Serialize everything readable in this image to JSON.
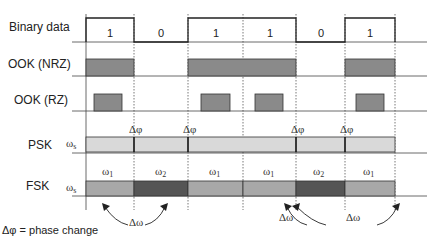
{
  "rows": {
    "binary": "Binary data",
    "ook_nrz": "OOK (NRZ)",
    "ook_rz": "OOK (RZ)",
    "psk": "PSK",
    "fsk": "FSK"
  },
  "bits": [
    "1",
    "0",
    "1",
    "1",
    "0",
    "1"
  ],
  "carrier_symbol": "ω",
  "carrier_sub": "s",
  "phase_change_symbol": "Δφ",
  "freq_change_symbol": "Δω",
  "fsk_freqs": [
    {
      "sym": "ω",
      "sub": "1"
    },
    {
      "sym": "ω",
      "sub": "2"
    },
    {
      "sym": "ω",
      "sub": "1"
    },
    {
      "sym": "ω",
      "sub": "1"
    },
    {
      "sym": "ω",
      "sub": "2"
    },
    {
      "sym": "ω",
      "sub": "1"
    }
  ],
  "legend": "Δφ = phase change",
  "colors": {
    "nrz_fill": "#8a8a8a",
    "rz_fill": "#8a8a8a",
    "psk_fill": "#d9d9d9",
    "fsk_light": "#a8a8a8",
    "fsk_dark": "#555555",
    "line": "#333333"
  }
}
